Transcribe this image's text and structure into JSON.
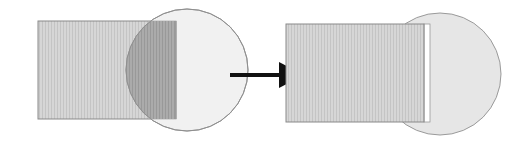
{
  "diagram": {
    "type": "before-after-shape-transformation",
    "colors": {
      "background": "#ffffff",
      "rect_fill": "#d4d4d4",
      "rect_stroke": "#8a8a8a",
      "circle_fill": "#e6e6e6",
      "circle_stroke": "#9a9a9a",
      "overlap_fill": "#a9a9a9",
      "arrow": "#111111",
      "gap_strip": "#ffffff"
    },
    "left_panel": {
      "label": "before",
      "rectangle": {
        "x": 38,
        "y": 21,
        "width": 138,
        "height": 98
      },
      "circle": {
        "cx": 187,
        "cy": 70,
        "r": 61
      },
      "overlap": "shaded darker (intersection region)"
    },
    "arrow": {
      "x1": 230,
      "y1": 75,
      "x2": 304,
      "y2": 75,
      "direction": "right"
    },
    "right_panel": {
      "label": "after",
      "rectangle": {
        "x": 286,
        "y": 24,
        "width": 138,
        "height": 98
      },
      "gap_strip": {
        "x": 424,
        "y": 24,
        "width": 6,
        "height": 98
      },
      "circle": {
        "cx": 440,
        "cy": 74,
        "r": 61
      }
    }
  }
}
